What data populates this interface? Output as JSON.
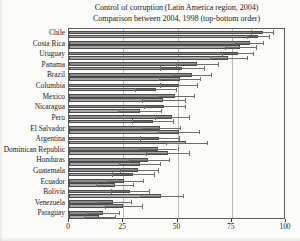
{
  "chart_data": {
    "type": "bar",
    "orientation": "horizontal",
    "title": "Control of corruption (Latin America region, 2004)",
    "subtitle": "Comparison between 2004, 1998 (top-bottom order)",
    "xlabel": "",
    "ylabel": "",
    "xlim": [
      0,
      100
    ],
    "xticks": [
      0,
      25,
      50,
      75,
      100
    ],
    "xticklabels": [
      "0",
      "25",
      "50",
      "75",
      "100"
    ],
    "grid": true,
    "grid_axis": "x",
    "legend": null,
    "legend_position": "none",
    "note": "Each country shows two bars: upper = 2004, lower = 1998 (top-bottom order). Horizontal whiskers are margin-of-error ranges.",
    "categories": [
      "Chile",
      "Costa Rica",
      "Uruguay",
      "Panama",
      "Brazil",
      "Columbia",
      "Mexico",
      "Nicaragua",
      "Peru",
      "El Salvador",
      "Argentina",
      "Dominican Republic",
      "Honduras",
      "Guatemala",
      "Ecuador",
      "Bolivia",
      "Venezuela",
      "Paraguay"
    ],
    "series": [
      {
        "name": "2004",
        "color": "#8e8e8e",
        "values": [
          89.5,
          83.5,
          78.0,
          59.0,
          56.5,
          50.5,
          49.0,
          44.0,
          47.5,
          42.0,
          41.5,
          41.0,
          36.5,
          32.0,
          25.5,
          28.0,
          20.5,
          15.5
        ],
        "err_low": [
          84.0,
          76.5,
          70.5,
          49.5,
          47.5,
          42.0,
          41.0,
          34.5,
          39.5,
          33.0,
          32.5,
          32.0,
          27.0,
          23.5,
          17.5,
          19.5,
          13.0,
          8.5
        ],
        "err_high": [
          94.0,
          89.5,
          85.0,
          68.5,
          65.5,
          59.0,
          57.5,
          53.5,
          55.5,
          51.0,
          50.5,
          50.0,
          46.0,
          41.0,
          34.0,
          37.0,
          28.5,
          23.0
        ]
      },
      {
        "name": "1998",
        "color": "#a9a9a9",
        "values": [
          87.0,
          79.0,
          73.5,
          52.0,
          51.0,
          40.0,
          43.5,
          32.5,
          38.5,
          50.5,
          54.0,
          45.5,
          32.5,
          29.5,
          21.0,
          42.5,
          25.0,
          14.0
        ],
        "err_low": [
          82.0,
          72.0,
          65.0,
          42.0,
          41.5,
          30.5,
          33.5,
          22.5,
          29.0,
          41.0,
          44.5,
          35.5,
          23.0,
          20.0,
          12.5,
          32.5,
          16.5,
          7.0
        ],
        "err_high": [
          92.0,
          86.0,
          82.0,
          62.0,
          60.5,
          49.5,
          53.5,
          42.5,
          48.0,
          60.0,
          63.5,
          55.5,
          42.0,
          39.0,
          29.5,
          52.5,
          33.5,
          21.0
        ]
      }
    ]
  }
}
